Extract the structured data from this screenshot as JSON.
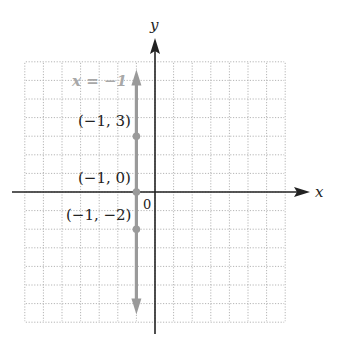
{
  "chart_data": {
    "type": "line",
    "title": "",
    "xlabel": "x",
    "ylabel": "y",
    "origin_label": "0",
    "xlim": [
      -7,
      7
    ],
    "ylim": [
      -7,
      7
    ],
    "grid": true,
    "grid_style": "dotted",
    "series": [
      {
        "name": "x = -1",
        "equation": "x = -1",
        "kind": "vertical line",
        "color": "#9a9a9a",
        "x": [
          -1,
          -1
        ],
        "y": [
          -6.8,
          6.8
        ]
      }
    ],
    "points": [
      {
        "label": "(−1, 3)",
        "x": -1,
        "y": 3
      },
      {
        "label": "(−1, 0)",
        "x": -1,
        "y": 0
      },
      {
        "label": "(−1, −2)",
        "x": -1,
        "y": -2
      }
    ],
    "annotations": [
      {
        "text": "x = −1",
        "x": -4.5,
        "y": 5.5,
        "color": "#a8a8a8"
      }
    ]
  },
  "colors": {
    "axis": "#222222",
    "grid": "#b5b5b5",
    "line": "#9a9a9a",
    "label": "#222222"
  }
}
